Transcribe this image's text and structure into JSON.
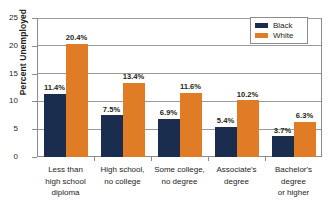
{
  "chart_data": {
    "type": "bar",
    "title": "",
    "xlabel": "",
    "ylabel": "Percent Unemployed",
    "ylim": [
      0,
      25
    ],
    "yticks": [
      0,
      5,
      10,
      15,
      20,
      25
    ],
    "ytick_labels": [
      "0",
      "5",
      "10",
      "15",
      "20",
      "25"
    ],
    "grid": true,
    "legend_position": "top-right",
    "categories": [
      "Less than\nhigh school\ndiploma",
      "High school,\nno college",
      "Some college,\nno degree",
      "Associate's\ndegree",
      "Bachelor's\ndegree\nor higher"
    ],
    "category_lines": [
      [
        "Less than",
        "high school",
        "diploma"
      ],
      [
        "High school,",
        "no college"
      ],
      [
        "Some college,",
        "no degree"
      ],
      [
        "Associate's",
        "degree"
      ],
      [
        "Bachelor's",
        "degree",
        "or higher"
      ]
    ],
    "series": [
      {
        "name": "Black",
        "color": "#1b2d4f",
        "values": [
          11.4,
          7.5,
          6.9,
          5.4,
          3.7
        ],
        "labels": [
          "11.4%",
          "7.5%",
          "6.9%",
          "5.4%",
          "3.7%"
        ]
      },
      {
        "name": "White",
        "color": "#e07c26",
        "values": [
          20.4,
          13.4,
          11.6,
          10.2,
          6.3
        ],
        "labels": [
          "20.4%",
          "13.4%",
          "11.6%",
          "10.2%",
          "6.3%"
        ]
      }
    ]
  },
  "legend": {
    "items": [
      {
        "label": "Black",
        "color": "#1b2d4f"
      },
      {
        "label": "White",
        "color": "#e07c26"
      }
    ]
  }
}
